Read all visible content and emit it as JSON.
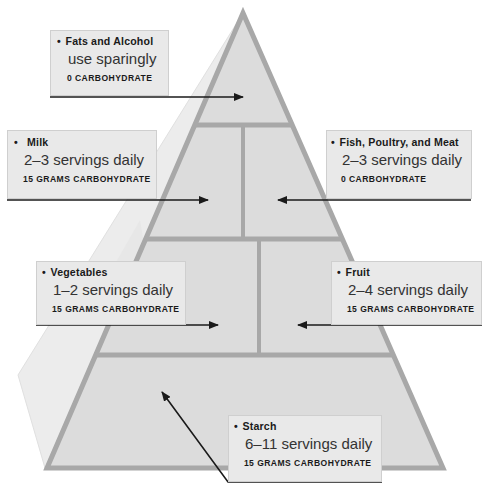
{
  "diagram": {
    "type": "food-pyramid",
    "colors": {
      "fill": "#dcdcdc",
      "border": "#a8a8a8",
      "shadow": "#ececec",
      "box": "#e9e9e9",
      "arrow": "#1a1a1a"
    },
    "groups": [
      {
        "id": "fats",
        "title": "Fats and Alcohol",
        "servings": "use sparingly",
        "carbs": "0 CARBOHYDRATE",
        "tier": 1
      },
      {
        "id": "milk",
        "title": "Milk",
        "servings": "2–3 servings daily",
        "carbs": "15 GRAMS CARBOHYDRATE",
        "tier": 2
      },
      {
        "id": "meat",
        "title": "Fish, Poultry, and Meat",
        "servings": "2–3 servings daily",
        "carbs": "0 CARBOHYDRATE",
        "tier": 2
      },
      {
        "id": "vegetables",
        "title": "Vegetables",
        "servings": "1–2 servings daily",
        "carbs": "15 GRAMS CARBOHYDRATE",
        "tier": 3
      },
      {
        "id": "fruit",
        "title": "Fruit",
        "servings": "2–4 servings daily",
        "carbs": "15 GRAMS CARBOHYDRATE",
        "tier": 3
      },
      {
        "id": "starch",
        "title": "Starch",
        "servings": "6–11 servings daily",
        "carbs": "15 GRAMS CARBOHYDRATE",
        "tier": 4
      }
    ],
    "bullet": "•"
  }
}
